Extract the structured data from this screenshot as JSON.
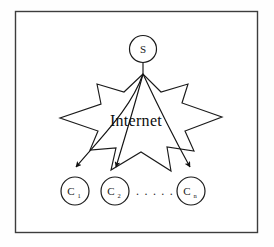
{
  "figure": {
    "border_color": "#3d3d3d",
    "stroke_color": "#1a1a1a",
    "background_color": "#fefefe"
  },
  "cloud": {
    "label": "Internet",
    "shape": "starburst"
  },
  "server": {
    "label": "S",
    "name": "server-node"
  },
  "clients": [
    {
      "label": "C",
      "subscript": "1",
      "name": "client-node-1"
    },
    {
      "label": "C",
      "subscript": "2",
      "name": "client-node-2"
    },
    {
      "label": "C",
      "subscript": "n",
      "name": "client-node-n"
    }
  ],
  "ellipsis": {
    "label": ". . . . ."
  },
  "edges": [
    {
      "from": "S",
      "to": "C1",
      "arrow": true
    },
    {
      "from": "S",
      "to": "C2",
      "arrow": true
    },
    {
      "from": "S",
      "to": "Cn",
      "arrow": true
    }
  ]
}
